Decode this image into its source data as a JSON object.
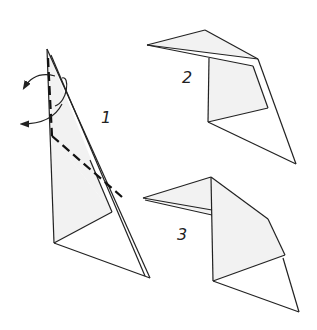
{
  "diagram": {
    "type": "origami-folding-steps",
    "steps": [
      {
        "number": "1",
        "label": "1",
        "instruction": "valley/mountain fold along dashed line, flip flap"
      },
      {
        "number": "2",
        "label": "2"
      },
      {
        "number": "3",
        "label": "3"
      }
    ],
    "colors": {
      "line": "#222222",
      "shade": "#f2f2f2",
      "background": "#ffffff"
    }
  }
}
